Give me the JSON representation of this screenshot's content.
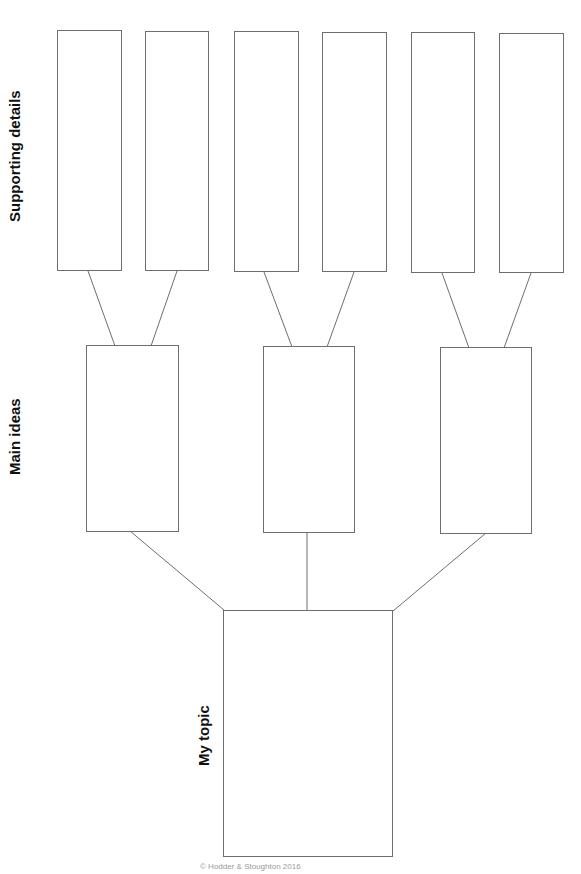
{
  "labels": {
    "supporting_details": "Supporting details",
    "main_ideas": "Main ideas",
    "my_topic": "My topic"
  },
  "footer": {
    "text": "© Hodder & Stoughton 2016"
  },
  "colors": {
    "line": "#6e6e6e",
    "text": "#111111"
  }
}
